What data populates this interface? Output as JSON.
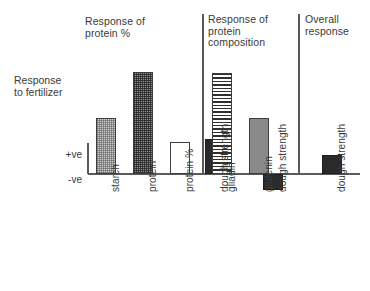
{
  "chart_data": {
    "type": "bar",
    "title": "",
    "xlabel": "",
    "ylabel": "Response\nto fertilizer",
    "ylim": [
      -0.25,
      1.0
    ],
    "grid": false,
    "legend": null,
    "baseline_value": 0,
    "ytick_labels": [
      "+ve",
      "-ve"
    ],
    "categories": [
      "starch",
      "protein",
      "protein %",
      "dough strength",
      "gliadin",
      "glutenin",
      "dough strength",
      "dough strength"
    ],
    "values": [
      0.55,
      1.0,
      0.31,
      0.34,
      0.99,
      0.55,
      -0.16,
      0.19
    ],
    "fills": [
      "light-stipple",
      "dark-stipple",
      "none",
      "solid-black",
      "horizontal-lines",
      "solid-gray",
      "solid-black",
      "solid-black"
    ],
    "groups": [
      {
        "label": "Response of\nprotein %",
        "categories": [
          "starch",
          "protein",
          "protein %",
          "dough strength"
        ]
      },
      {
        "label": "Response of\nprotein\ncomposition",
        "categories": [
          "gliadin",
          "glutenin",
          "dough strength"
        ]
      },
      {
        "label": "Overall\nresponse",
        "categories": [
          "dough strength"
        ]
      }
    ],
    "series": [
      {
        "name": "Response to fertilizer",
        "values": [
          0.55,
          1.0,
          0.31,
          0.34,
          0.99,
          0.55,
          -0.16,
          0.19
        ]
      }
    ]
  },
  "figure": {
    "axis_caption": "Response\nto fertilizer",
    "tick_positive": "+ve",
    "tick_negative": "-ve",
    "group_titles": [
      "Response of\nprotein %",
      "Response of\nprotein\ncomposition",
      "Overall\nresponse"
    ],
    "category_labels": [
      "starch",
      "protein",
      "protein %",
      "dough strength",
      "gliadin",
      "glutenin",
      "dough strength",
      "dough strength"
    ],
    "colors": {
      "ink": "#3a3a3a",
      "axis": "#5a5a5a",
      "bar_outline": "#3d3d3d",
      "solid_black": "#2a2a2a",
      "solid_gray": "#8a8a8a",
      "light_stipple": "#cfcfcf",
      "dark_stipple": "#8d8d8d",
      "background": "#ffffff"
    }
  }
}
